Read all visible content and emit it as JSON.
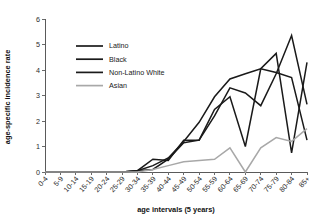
{
  "chart_data": {
    "type": "line",
    "title": "",
    "xlabel": "age intervals (5 years)",
    "ylabel": "age-specific incidence rate",
    "categories": [
      "0-4",
      "5-9",
      "10-14",
      "15-19",
      "20-24",
      "25-29",
      "30-34",
      "35-39",
      "40-44",
      "45-49",
      "50-54",
      "55-59",
      "60-64",
      "65-69",
      "70-74",
      "75-79",
      "80-84",
      "85+"
    ],
    "ylim": [
      0,
      6
    ],
    "yticks": [
      0,
      1,
      2,
      3,
      4,
      5,
      6
    ],
    "grid": false,
    "legend_position": "upper-left-inside",
    "series": [
      {
        "name": "Latino",
        "color": "#1a1a1a",
        "width": 1.5,
        "values": [
          0,
          0,
          0,
          0,
          0,
          0,
          0.05,
          0.5,
          0.45,
          1.25,
          1.25,
          2.45,
          2.95,
          1.0,
          4.05,
          4.65,
          0.75,
          4.3
        ]
      },
      {
        "name": "Black",
        "color": "#1a1a1a",
        "width": 1.5,
        "values": [
          0,
          0,
          0,
          0,
          0,
          0,
          0.05,
          0.1,
          0.5,
          1.15,
          1.25,
          2.2,
          3.3,
          3.1,
          2.6,
          3.85,
          5.35,
          2.65
        ]
      },
      {
        "name": "Non-Latino White",
        "color": "#1a1a1a",
        "width": 1.5,
        "values": [
          0,
          0,
          0,
          0,
          0,
          0,
          0.05,
          0.25,
          0.55,
          1.2,
          1.95,
          2.95,
          3.65,
          3.85,
          4.05,
          3.9,
          3.7,
          1.25
        ]
      },
      {
        "name": "Asian",
        "color": "#a8a8a8",
        "width": 1.5,
        "values": [
          0,
          0,
          0,
          0,
          0,
          0,
          0.0,
          0.1,
          0.25,
          0.4,
          0.45,
          0.5,
          0.95,
          0.0,
          0.95,
          1.35,
          1.2,
          1.7
        ]
      }
    ],
    "legend": [
      {
        "label": "Latino",
        "color": "#1a1a1a"
      },
      {
        "label": "Black",
        "color": "#1a1a1a"
      },
      {
        "label": "Non-Latino White",
        "color": "#1a1a1a"
      },
      {
        "label": "Asian",
        "color": "#a8a8a8"
      }
    ]
  }
}
